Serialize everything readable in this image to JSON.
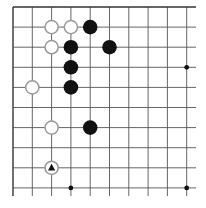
{
  "board": {
    "description": "Go board corner diagram (top-left), 10 visible columns x 10 visible rows",
    "colors": {
      "background": "#ffffff",
      "line": "#555555",
      "border": "#333333",
      "black_stone": "#111111",
      "white_stone_fill": "#ffffff",
      "white_stone_edge": "#999999",
      "marker": "#111111"
    },
    "grid": {
      "origin_x": 13,
      "origin_y": 7,
      "spacing_x": 19.3,
      "spacing_y": 20.1,
      "cols": 10,
      "rows": 10,
      "extend_right": 196,
      "extend_bottom": 196
    },
    "star_points": [
      {
        "col": 9,
        "row": 3
      },
      {
        "col": 3,
        "row": 9
      },
      {
        "col": 9,
        "row": 9
      }
    ],
    "stones": [
      {
        "color": "white",
        "col": 2,
        "row": 1
      },
      {
        "color": "white",
        "col": 3,
        "row": 1
      },
      {
        "color": "black",
        "col": 4,
        "row": 1
      },
      {
        "color": "white",
        "col": 2,
        "row": 2
      },
      {
        "color": "black",
        "col": 3,
        "row": 2
      },
      {
        "color": "black",
        "col": 5,
        "row": 2
      },
      {
        "color": "black",
        "col": 3,
        "row": 3
      },
      {
        "color": "white",
        "col": 1,
        "row": 4
      },
      {
        "color": "black",
        "col": 3,
        "row": 4
      },
      {
        "color": "white",
        "col": 2,
        "row": 6
      },
      {
        "color": "black",
        "col": 4,
        "row": 6
      },
      {
        "color": "white",
        "col": 2,
        "row": 8,
        "marker": "triangle-icon"
      }
    ]
  }
}
